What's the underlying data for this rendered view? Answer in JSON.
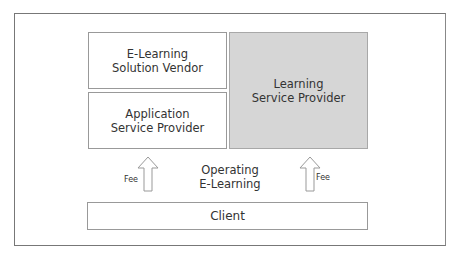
{
  "diagram": {
    "boxes": {
      "vendor": "E-Learning\nSolution Vendor",
      "asp": "Application\nService Provider",
      "lsp": "Learning\nService Provider",
      "client": "Client"
    },
    "center_label": "Operating\nE-Learning",
    "left_arrow_label": "Fee",
    "right_arrow_label": "Fee",
    "colors": {
      "lsp_fill": "#d6d6d6",
      "border": "#999999"
    }
  }
}
